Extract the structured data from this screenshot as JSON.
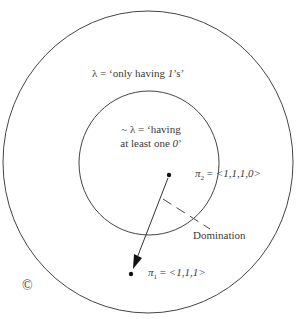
{
  "diagram": {
    "outer_region": {
      "label": "λ = ‘only having 1’s’",
      "label_parts": [
        "λ = ‘only having ",
        "1",
        "’s’"
      ]
    },
    "inner_region": {
      "label_line1": "~ λ = ‘having",
      "label_line2_prefix": "at least one ",
      "label_line2_italic": "0",
      "label_line2_suffix": "’"
    },
    "points": [
      {
        "id": "pi2",
        "symbol": "π",
        "subscript": "2",
        "equals": " = ",
        "value": "<1,1,1,0>"
      },
      {
        "id": "pi1",
        "symbol": "π",
        "subscript": "1",
        "equals": " = ",
        "value": "<1,1,1>"
      }
    ],
    "arrow_label": "Domination",
    "corner_mark": "©"
  }
}
